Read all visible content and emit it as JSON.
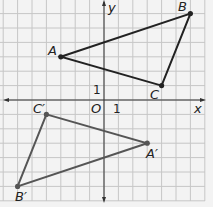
{
  "diagram": {
    "type": "coordinate-grid-rotation",
    "axes": {
      "x_label": "x",
      "y_label": "y",
      "origin_label": "O",
      "x_tick_label": "1",
      "y_tick_label": "1",
      "x_range": [
        -7,
        7
      ],
      "y_range": [
        -7,
        7
      ]
    },
    "triangles": [
      {
        "name": "ABC",
        "color": "#222222",
        "points": [
          {
            "label": "A",
            "x": -3,
            "y": 3
          },
          {
            "label": "B",
            "x": 6,
            "y": 6
          },
          {
            "label": "C",
            "x": 4,
            "y": 1
          }
        ]
      },
      {
        "name": "A'B'C'",
        "color": "#555555",
        "points": [
          {
            "label": "A′",
            "x": 3,
            "y": -3
          },
          {
            "label": "B′",
            "x": -6,
            "y": -6
          },
          {
            "label": "C′",
            "x": -4,
            "y": -1
          }
        ]
      }
    ],
    "colors": {
      "background": "#f3f3f3",
      "grid": "#c6c6c6",
      "axis": "#333333"
    }
  }
}
